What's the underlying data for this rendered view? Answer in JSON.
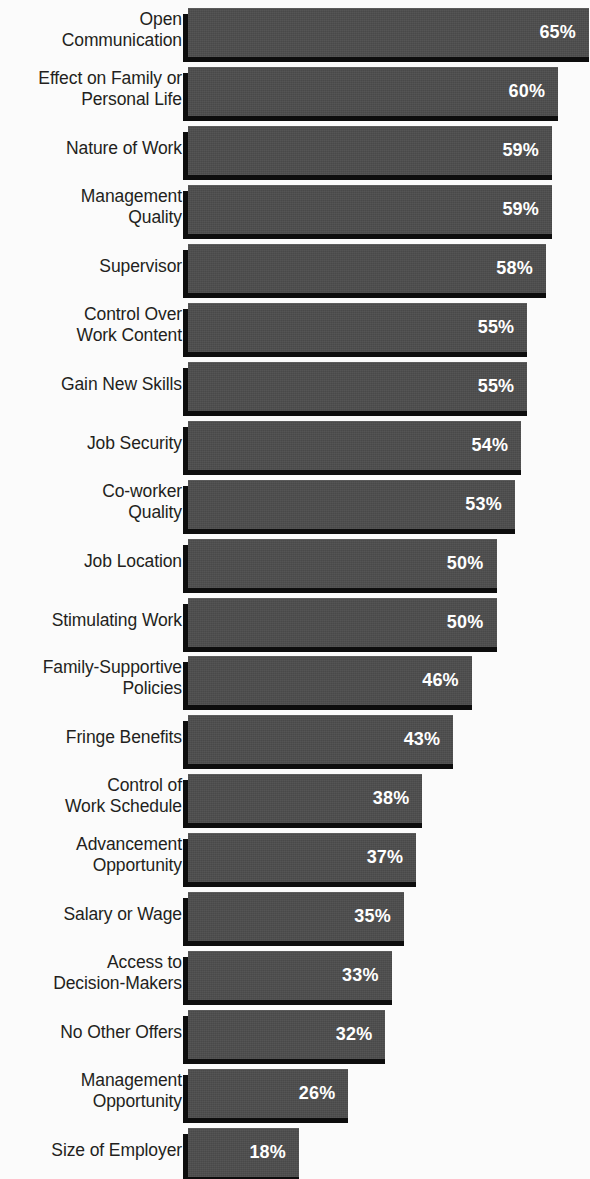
{
  "chart_data": {
    "type": "bar",
    "orientation": "horizontal",
    "title": "",
    "subtitle": "",
    "xlabel": "",
    "ylabel": "",
    "xlim": [
      0,
      70
    ],
    "grid": false,
    "legend": null,
    "value_suffix": "%",
    "categories": [
      "Open Communication",
      "Effect on Family or Personal Life",
      "Nature of Work",
      "Management Quality",
      "Supervisor",
      "Control Over Work Content",
      "Gain New Skills",
      "Job Security",
      "Co-worker Quality",
      "Job Location",
      "Stimulating Work",
      "Family-Supportive Policies",
      "Fringe Benefits",
      "Control of Work Schedule",
      "Advancement Opportunity",
      "Salary or Wage",
      "Access to Decision-Makers",
      "No Other Offers",
      "Management Opportunity",
      "Size of Employer"
    ],
    "values": [
      65,
      60,
      59,
      59,
      58,
      55,
      55,
      54,
      53,
      50,
      50,
      46,
      43,
      38,
      37,
      35,
      33,
      32,
      26,
      18
    ],
    "value_labels": [
      "65%",
      "60%",
      "59%",
      "59%",
      "58%",
      "55%",
      "55%",
      "54%",
      "53%",
      "50%",
      "50%",
      "46%",
      "43%",
      "38%",
      "37%",
      "35%",
      "33%",
      "32%",
      "26%",
      "18%"
    ]
  },
  "rows": [
    {
      "label": "Open\nCommunication",
      "value": 65,
      "value_label": "65%"
    },
    {
      "label": "Effect on Family or\nPersonal Life",
      "value": 60,
      "value_label": "60%"
    },
    {
      "label": "Nature of Work",
      "value": 59,
      "value_label": "59%"
    },
    {
      "label": "Management\nQuality",
      "value": 59,
      "value_label": "59%"
    },
    {
      "label": "Supervisor",
      "value": 58,
      "value_label": "58%"
    },
    {
      "label": "Control Over\nWork Content",
      "value": 55,
      "value_label": "55%"
    },
    {
      "label": "Gain New Skills",
      "value": 55,
      "value_label": "55%"
    },
    {
      "label": "Job Security",
      "value": 54,
      "value_label": "54%"
    },
    {
      "label": "Co-worker\nQuality",
      "value": 53,
      "value_label": "53%"
    },
    {
      "label": "Job Location",
      "value": 50,
      "value_label": "50%"
    },
    {
      "label": "Stimulating Work",
      "value": 50,
      "value_label": "50%"
    },
    {
      "label": "Family-Supportive\nPolicies",
      "value": 46,
      "value_label": "46%"
    },
    {
      "label": "Fringe Benefits",
      "value": 43,
      "value_label": "43%"
    },
    {
      "label": "Control of\nWork Schedule",
      "value": 38,
      "value_label": "38%"
    },
    {
      "label": "Advancement\nOpportunity",
      "value": 37,
      "value_label": "37%"
    },
    {
      "label": "Salary or Wage",
      "value": 35,
      "value_label": "35%"
    },
    {
      "label": "Access to\nDecision-Makers",
      "value": 33,
      "value_label": "33%"
    },
    {
      "label": "No Other Offers",
      "value": 32,
      "value_label": "32%"
    },
    {
      "label": "Management\nOpportunity",
      "value": 26,
      "value_label": "26%"
    },
    {
      "label": "Size of Employer",
      "value": 18,
      "value_label": "18%"
    }
  ],
  "style": {
    "background": "#fbfbfb",
    "bar_fill": "#4c4c4c",
    "bar_shadow": "#0d0d0d",
    "label_color": "#231f20",
    "value_color": "#ffffff"
  },
  "geometry": {
    "row_pitch": 58.95,
    "first_row_top": 4,
    "bar_origin_x": 188,
    "px_per_percent": 6.17,
    "bar_height": 48
  }
}
